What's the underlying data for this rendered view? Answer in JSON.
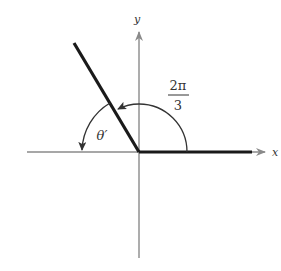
{
  "figure": {
    "axes": {
      "x_label": "x",
      "y_label": "y"
    },
    "angle": {
      "numerator": "2π",
      "denominator": "3",
      "value_radians": "2π/3",
      "reference_angle_label": "θ′"
    },
    "colors": {
      "axis": "#8a8a8a",
      "ray": "#1a1a1a",
      "arc": "#333333",
      "text": "#333333"
    }
  }
}
